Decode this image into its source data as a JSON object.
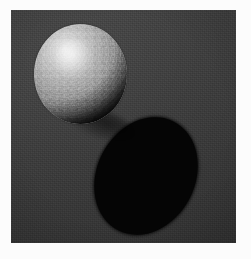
{
  "scene": {
    "title": "Rendered sphere with cast shadow",
    "description": "A textured matte sphere resembling an orange, lit from the upper left, resting above a flat dark surface with a large elliptical cast shadow falling to the lower right.",
    "render_style": "3D raytraced still",
    "image_width": 251,
    "image_height": 259
  },
  "plate": {
    "name": "render-plate",
    "left": 11,
    "top": 10,
    "width": 225,
    "height": 233,
    "page_margin_color": "#fcfcfc"
  },
  "background": {
    "name": "flat-backdrop",
    "base_color": "#3b3b3b",
    "highlight_color": "#404040",
    "shade_color": "#343434",
    "grain": "visible render noise"
  },
  "sphere": {
    "name": "sphere-object",
    "label": "sphere",
    "surface": "dimpled citrus peel",
    "center_x": 80,
    "center_y": 74,
    "width": 93,
    "height": 100,
    "lit_color": "#e9e9e9",
    "midtone_color": "#9d9d9d",
    "terminator_color": "#050505",
    "specular_color": "#ffffff",
    "highlight_x": 32,
    "highlight_y": 27
  },
  "cast_shadow": {
    "name": "cast-shadow-ellipse",
    "label": "cast shadow",
    "color": "#050505",
    "center_x": 146,
    "center_y": 176,
    "width": 98,
    "height": 122,
    "rotation_deg": 27
  },
  "lighting": {
    "key_light_direction": "upper-left",
    "shadow_direction": "lower-right",
    "ambient_level": "low"
  },
  "palette": {
    "background": "#3b3b3b",
    "shadow": "#050505",
    "sphere_highlight": "#e9e9e9",
    "sphere_midtone": "#9d9d9d",
    "page": "#fcfcfc"
  }
}
